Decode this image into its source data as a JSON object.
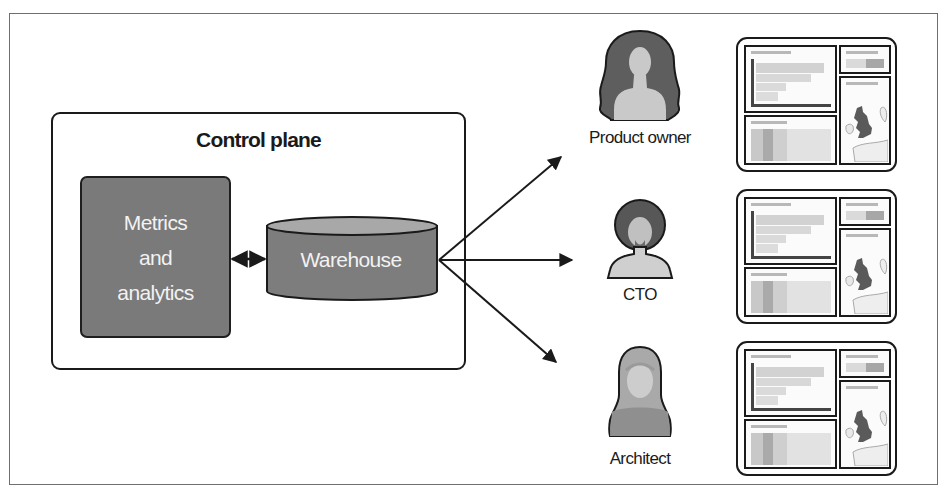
{
  "diagram": {
    "control_plane": {
      "title": "Control plane",
      "metrics": {
        "lines": [
          "Metrics",
          "and",
          "analytics"
        ]
      },
      "warehouse": {
        "label": "Warehouse"
      },
      "connector": "bidirectional-arrow"
    },
    "edges": [
      {
        "from": "Warehouse",
        "to": "Product owner",
        "type": "arrow"
      },
      {
        "from": "Warehouse",
        "to": "CTO",
        "type": "arrow"
      },
      {
        "from": "Warehouse",
        "to": "Architect",
        "type": "arrow"
      }
    ],
    "personas": [
      {
        "label": "Product owner",
        "icon": "woman-long-hair-avatar-icon"
      },
      {
        "label": "CTO",
        "icon": "man-afro-beard-avatar-icon"
      },
      {
        "label": "Architect",
        "icon": "woman-hijab-avatar-icon"
      }
    ],
    "dashboards": [
      {
        "icon": "dashboard-icon",
        "panels": [
          "bar-chart",
          "kpi",
          "heatmap",
          "map-uk"
        ]
      },
      {
        "icon": "dashboard-icon",
        "panels": [
          "bar-chart",
          "kpi",
          "heatmap",
          "map-uk"
        ]
      },
      {
        "icon": "dashboard-icon",
        "panels": [
          "bar-chart",
          "kpi",
          "heatmap",
          "map-uk"
        ]
      }
    ],
    "colors": {
      "box_fill": "#7a7a7a",
      "cylinder_top": "#a8a8a8",
      "stroke": "#1a1a1a",
      "text_on_dark": "#f2f2f2",
      "hair": "#5c5c5c",
      "skin": "#c9c9c9"
    }
  }
}
